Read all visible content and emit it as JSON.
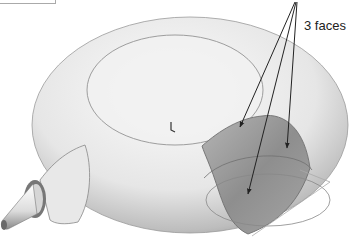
{
  "diagram": {
    "annotation_label": "3 faces",
    "shape": "torus-body-with-conical-nozzle",
    "colors": {
      "body_light": "#f4f4f4",
      "body_mid": "#cfcfcf",
      "body_dark": "#8a8a8a",
      "faces_fill": "#9a9a9a",
      "edge_line": "#777777",
      "arrow": "#222222"
    },
    "arrow_count": 3
  }
}
